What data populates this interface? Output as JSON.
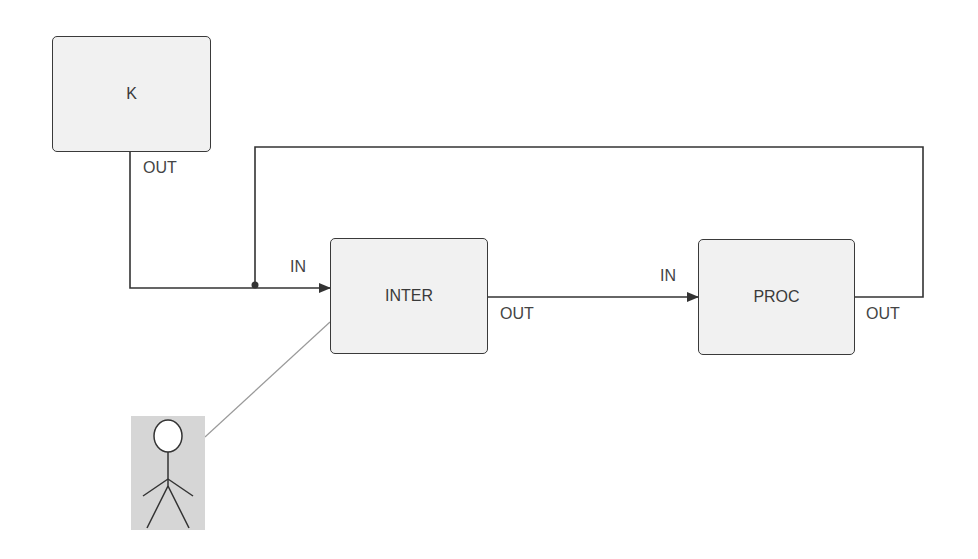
{
  "diagram": {
    "blocks": [
      {
        "id": "k",
        "label": "K",
        "port_out": "OUT"
      },
      {
        "id": "inter",
        "label": "INTER",
        "port_in": "IN",
        "port_out": "OUT"
      },
      {
        "id": "proc",
        "label": "PROC",
        "port_in": "IN",
        "port_out": "OUT"
      }
    ],
    "actor": {
      "name": "user"
    },
    "connections": [
      {
        "from": "K.OUT",
        "to": "INTER.IN"
      },
      {
        "from": "INTER.OUT",
        "to": "PROC.IN"
      },
      {
        "from": "PROC.OUT",
        "to": "INTER.IN",
        "type": "feedback"
      },
      {
        "from": "actor",
        "to": "INTER",
        "type": "association"
      }
    ],
    "colors": {
      "line": "#333333",
      "box_fill": "#f1f1f1",
      "actor_bg": "#d6d6d6",
      "association": "#9a9a9a"
    }
  }
}
